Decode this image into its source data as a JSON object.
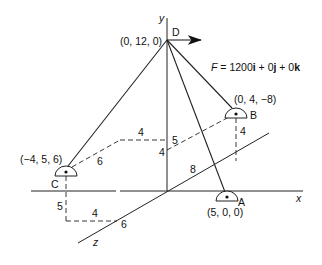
{
  "diagram": {
    "axes": {
      "x_label": "x",
      "y_label": "y",
      "z_label": "z"
    },
    "points": {
      "D": {
        "name": "D",
        "coords": "(0, 12, 0)"
      },
      "B": {
        "name": "B",
        "coords": "(0, 4, −8)"
      },
      "C": {
        "name": "C",
        "coords": "(−4, 5, 6)"
      },
      "A": {
        "name": "A",
        "coords": "(5, 0, 0)"
      }
    },
    "force": {
      "prefix": "F",
      "eq": " = 1200",
      "i": "i",
      "mid1": " + 0",
      "j": "j",
      "mid2": " + 0",
      "k": "k"
    },
    "dimensions": {
      "c_to_yaxis_horizontal": "4",
      "c_diag": "6",
      "y_offset_5": "5",
      "y_offset_4": "4",
      "b_drop": "4",
      "z_8": "8",
      "c_drop": "5",
      "c_bottom_4": "4",
      "z_6": "6"
    },
    "colors": {
      "line": "#222222",
      "text": "#111111",
      "background": "#ffffff"
    }
  }
}
